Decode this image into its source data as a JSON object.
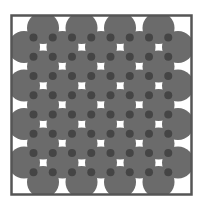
{
  "diagram": {
    "type": "circle-packing-lattice",
    "frame": {
      "x": 11.5,
      "y": 15.5,
      "width": 180,
      "height": 179,
      "stroke": "#555555",
      "stroke_width": 2.5
    },
    "circle_color": "#6b6b6b",
    "dot_color": "#454545",
    "circle_radius": 16,
    "dot_radius": 4,
    "rows_a": {
      "y": [
        28,
        66.5,
        105,
        143.5,
        182
      ],
      "x": [
        43,
        81.5,
        120,
        158.5
      ]
    },
    "rows_b": {
      "y": [
        47,
        85.5,
        124,
        162.5
      ],
      "x": [
        24,
        62.5,
        101,
        139.5,
        178
      ]
    }
  }
}
